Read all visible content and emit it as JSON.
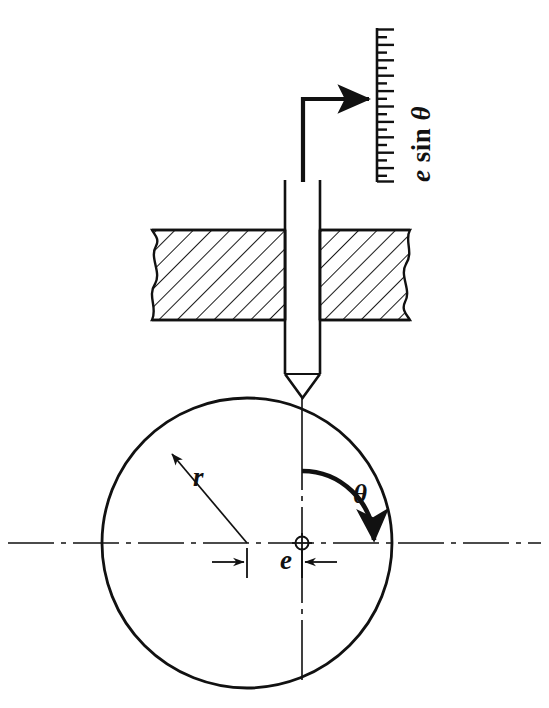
{
  "figure": {
    "background_color": "#ffffff",
    "line_color": "#111111",
    "width": 549,
    "height": 708
  },
  "labels": {
    "scale_label_e": "e",
    "scale_label_sin": " sin ",
    "scale_label_theta": "θ",
    "scale_label_full": "e sin θ",
    "radius": "r",
    "eccentricity": "e",
    "angle": "θ"
  },
  "components": {
    "scale": {
      "name": "measurement-scale",
      "x": 377,
      "y_top": 28,
      "y_bottom": 182,
      "tick_count": 21,
      "tick_long_px": 17,
      "tick_short_px": 10
    },
    "pointer": {
      "name": "pointer-arrow",
      "stem_x": 303,
      "stem_top": 99,
      "stem_bottom": 182,
      "arrow_tip_x": 377,
      "arrow_y": 99
    },
    "follower_rod": {
      "name": "follower-rod",
      "left": 285,
      "right": 320,
      "top": 180,
      "tip_base_y": 374,
      "tip_point_y": 398
    },
    "guide_block": {
      "name": "guide-block",
      "left": 152,
      "right": 410,
      "top": 230,
      "bottom": 320,
      "hatch_angle_deg": 45,
      "hatch_spacing_px": 13
    },
    "cam_circle": {
      "name": "cam-circle",
      "center_x": 247,
      "center_y": 543,
      "radius": 145
    },
    "rotation_center": {
      "name": "rotation-center",
      "x": 302,
      "y": 543,
      "marker": "circle-with-cross"
    },
    "centerlines": {
      "horizontal_y": 543,
      "vertical_x": 302,
      "dash_pattern": "long-dot-long"
    },
    "radius_leader": {
      "name": "radius-leader-line",
      "from_x": 247,
      "from_y": 543,
      "to_x": 167,
      "to_y": 448
    },
    "theta_arc": {
      "name": "theta-rotation-arc",
      "center_x": 302,
      "center_y": 543,
      "radius": 72,
      "start_deg": 90,
      "end_deg": 0,
      "direction": "clockwise"
    },
    "eccentricity_dimension": {
      "name": "eccentricity-dimension",
      "left_ext_x": 247,
      "right_ext_x": 302,
      "dim_y": 562,
      "label": "e"
    }
  }
}
